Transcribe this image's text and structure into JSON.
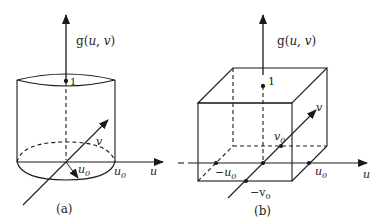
{
  "panel_a": {
    "caption": "(a)",
    "g_label": "g(",
    "g_u": "u",
    "g_comma": ", ",
    "g_v": "v",
    "g_close": ")",
    "one": "1",
    "v_axis": "v",
    "u_axis": "u",
    "u0_radius": "u",
    "u0_edge": "u",
    "sub0": "0"
  },
  "panel_b": {
    "caption": "(b)",
    "g_label": "g(",
    "g_u": "u",
    "g_comma": ", ",
    "g_v": "v",
    "g_close": ")",
    "one": "1",
    "v_axis": "v",
    "u_axis": "u",
    "v0": "v",
    "neg_v0": "−v",
    "neg_u0": "−u",
    "u0": "u",
    "sub0": "0"
  },
  "colors": {
    "stroke": "#1a1a1a",
    "text": "#222222"
  }
}
